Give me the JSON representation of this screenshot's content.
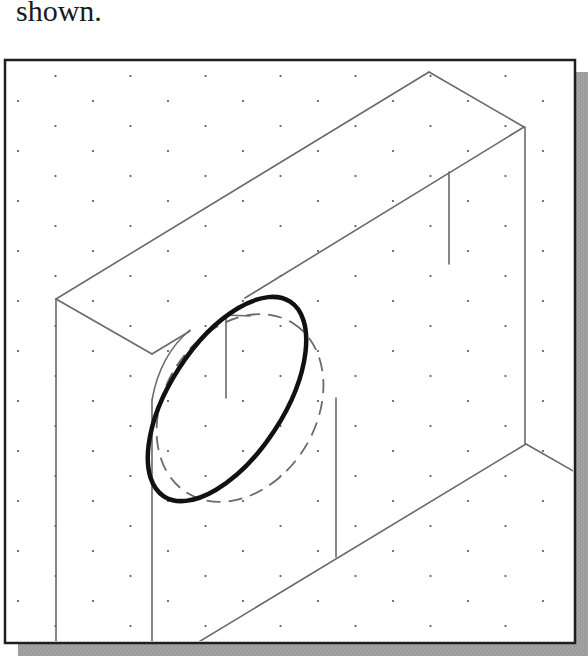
{
  "caption": {
    "text": "shown."
  },
  "figure": {
    "frame": {
      "x": 4,
      "y": 59,
      "width": 571,
      "height": 584,
      "border_color": "#1e1e1e",
      "shadow_color": "#9a9a9a"
    },
    "grid": {
      "type": "isometric-dots",
      "dx": 75,
      "dy": 25,
      "origin_x": 18,
      "origin_y": 76,
      "dot_color": "#555555"
    },
    "line_color": "#6a6a6a",
    "thick_ellipse": {
      "cx": 227,
      "cy": 399,
      "rx": 116,
      "ry": 57,
      "rotation": -57,
      "color": "#111111",
      "stroke_width": 4.5
    },
    "dashed_ellipse": {
      "cx": 240,
      "cy": 408,
      "rx": 100,
      "ry": 76,
      "rotation": -58,
      "color": "#6a6a6a",
      "dash": "14 8"
    }
  }
}
